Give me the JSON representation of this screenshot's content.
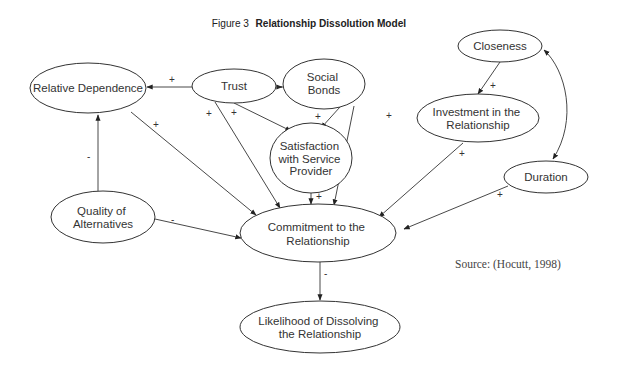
{
  "title": {
    "prefix": "Figure 3",
    "name": "Relationship Dissolution Model"
  },
  "nodes": {
    "relative_dependence": {
      "lines": [
        "Relative Dependence"
      ]
    },
    "trust": {
      "lines": [
        "Trust"
      ]
    },
    "social_bonds": {
      "lines": [
        "Social",
        "Bonds"
      ]
    },
    "closeness": {
      "lines": [
        "Closeness"
      ]
    },
    "investment": {
      "lines": [
        "Investment in the",
        "Relationship"
      ]
    },
    "satisfaction": {
      "lines": [
        "Satisfaction",
        "with Service",
        "Provider"
      ]
    },
    "duration": {
      "lines": [
        "Duration"
      ]
    },
    "quality": {
      "lines": [
        "Quality of",
        "Alternatives"
      ]
    },
    "commitment": {
      "lines": [
        "Commitment to the",
        "Relationship"
      ]
    },
    "likelihood": {
      "lines": [
        "Likelihood of Dissolving",
        "the Relationship"
      ]
    }
  },
  "edges": [
    {
      "from": "Trust",
      "to": "Relative Dependence",
      "sign": "+"
    },
    {
      "from": "Trust",
      "to": "Social Bonds",
      "sign": "+"
    },
    {
      "from": "Trust",
      "to": "Satisfaction with Service Provider",
      "sign": "+"
    },
    {
      "from": "Trust",
      "to": "Commitment to the Relationship",
      "sign": "+"
    },
    {
      "from": "Social Bonds",
      "to": "Satisfaction with Service Provider",
      "sign": "+"
    },
    {
      "from": "Social Bonds",
      "to": "Commitment to the Relationship",
      "sign": "+"
    },
    {
      "from": "Relative Dependence",
      "to": "Commitment to the Relationship",
      "sign": "+"
    },
    {
      "from": "Quality of Alternatives",
      "to": "Relative Dependence",
      "sign": "-"
    },
    {
      "from": "Quality of Alternatives",
      "to": "Commitment to the Relationship",
      "sign": "-"
    },
    {
      "from": "Satisfaction with Service Provider",
      "to": "Commitment to the Relationship",
      "sign": "+"
    },
    {
      "from": "Closeness",
      "to": "Investment in the Relationship",
      "sign": "+"
    },
    {
      "from": "Investment in the Relationship",
      "to": "Commitment to the Relationship",
      "sign": "+"
    },
    {
      "from": "Duration",
      "to": "Commitment to the Relationship",
      "sign": "+"
    },
    {
      "from": "Closeness",
      "to": "Duration",
      "sign": "",
      "bidirectional": true
    },
    {
      "from": "Commitment to the Relationship",
      "to": "Likelihood of Dissolving the Relationship",
      "sign": "-"
    }
  ],
  "signs": {
    "plus": "+",
    "minus": "-"
  },
  "source": "Source: (Hocutt, 1998)"
}
